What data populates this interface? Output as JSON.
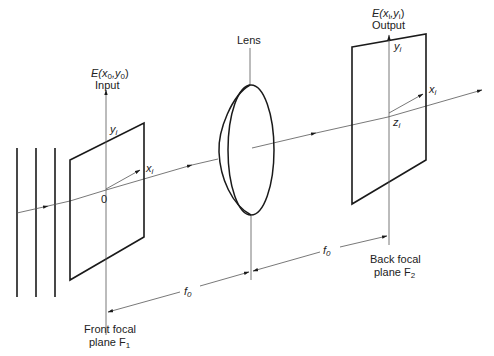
{
  "diagram": {
    "type": "optical-fourier-transform-setup",
    "colors": {
      "stroke": "#1a1a1a",
      "axis": "#555555",
      "background": "#ffffff"
    },
    "input_plane": {
      "field_label": "E(x",
      "field_sub0": "0",
      "field_mid": ",y",
      "field_sub1": "0",
      "field_close": ")",
      "name": "Input",
      "y_axis": "y",
      "y_sub": "i",
      "x_axis": "x",
      "x_sub": "i",
      "origin": "0"
    },
    "lens": {
      "label": "Lens"
    },
    "output_plane": {
      "field_label": "E(x",
      "field_sub0": "i",
      "field_mid": ",y",
      "field_sub1": "i",
      "field_close": ")",
      "name": "Output",
      "y_axis": "y",
      "y_sub": "i",
      "x_axis": "x",
      "x_sub": "i",
      "z_axis": "z",
      "z_sub": "i"
    },
    "distances": {
      "front": {
        "label": "f",
        "sub": "0"
      },
      "back": {
        "label": "f",
        "sub": "0"
      }
    },
    "front_focal_plane": {
      "line1": "Front focal",
      "line2": "plane F",
      "sub": "1"
    },
    "back_focal_plane": {
      "line1": "Back focal",
      "line2": "plane F",
      "sub": "2"
    },
    "wavefronts": {
      "count": 3
    }
  }
}
